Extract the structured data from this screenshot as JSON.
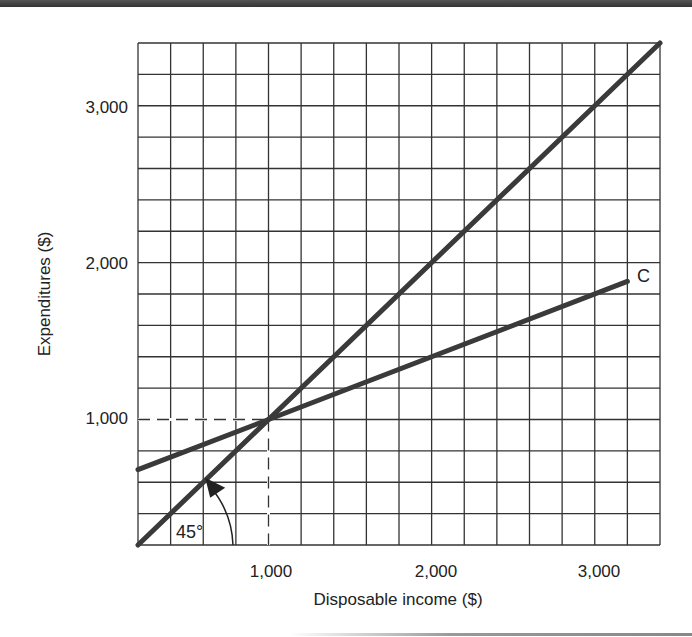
{
  "chart_data": {
    "type": "line",
    "title": "",
    "xlabel": "Disposable income ($)",
    "ylabel": "Expenditures ($)",
    "xlim": [
      200,
      3400
    ],
    "ylim": [
      200,
      3400
    ],
    "grid": true,
    "grid_step": 200,
    "x_ticks": [
      1000,
      2000,
      3000
    ],
    "x_tick_labels": [
      "1,000",
      "2,000",
      "3,000"
    ],
    "y_ticks": [
      1000,
      2000,
      3000
    ],
    "y_tick_labels": [
      "1,000",
      "2,000",
      "3,000"
    ],
    "series": [
      {
        "name": "45-degree line",
        "x": [
          200,
          3400
        ],
        "y": [
          200,
          3400
        ]
      },
      {
        "name": "C",
        "x": [
          200,
          1000,
          3200
        ],
        "y": [
          680,
          1000,
          1880
        ]
      }
    ],
    "annotations": [
      {
        "text": "C",
        "at": [
          3200,
          1880
        ]
      },
      {
        "text": "45°",
        "at": [
          500,
          300
        ],
        "note": "arc arrow marking 45-degree angle"
      },
      {
        "text": "dashed guide lines",
        "at": [
          1000,
          1000
        ]
      }
    ],
    "legend": "none"
  },
  "labels": {
    "x_axis": "Disposable income ($)",
    "y_axis": "Expenditures ($)",
    "x_ticks": [
      "1,000",
      "2,000",
      "3,000"
    ],
    "y_ticks": [
      "1,000",
      "2,000",
      "3,000"
    ],
    "consumption_label": "C",
    "angle_label": "45°"
  },
  "colors": {
    "grid": "#333333",
    "line": "#3a3a3a",
    "text": "#222222",
    "background": "#ffffff"
  }
}
